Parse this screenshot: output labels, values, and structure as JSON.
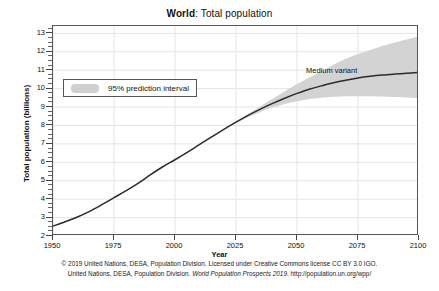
{
  "chart_data": {
    "type": "line",
    "title": "World: Total population",
    "title_bold_part": "World",
    "title_rest": ": Total population",
    "xlabel": "Year",
    "ylabel": "Total population (billions)",
    "xlim": [
      1950,
      2100
    ],
    "ylim": [
      2,
      13.4
    ],
    "xticks": [
      1950,
      1975,
      2000,
      2025,
      2050,
      2075,
      2100
    ],
    "yticks": [
      2,
      3,
      4,
      5,
      6,
      7,
      8,
      9,
      10,
      11,
      12,
      13
    ],
    "grid": true,
    "legend_position": "upper-left",
    "legend": [
      {
        "label": "95% prediction interval",
        "color": "#d0d0d0",
        "style": "band"
      }
    ],
    "annotations": [
      {
        "text": "Medium variant",
        "x": 2062,
        "y": 10.6
      }
    ],
    "series": [
      {
        "name": "Medium variant",
        "color": "#2b2b2b",
        "x": [
          1950,
          1955,
          1960,
          1965,
          1970,
          1975,
          1980,
          1985,
          1990,
          1995,
          2000,
          2005,
          2010,
          2015,
          2020,
          2025,
          2030,
          2035,
          2040,
          2045,
          2050,
          2055,
          2060,
          2065,
          2070,
          2075,
          2080,
          2085,
          2090,
          2095,
          2100
        ],
        "values": [
          2.54,
          2.77,
          3.03,
          3.34,
          3.7,
          4.08,
          4.46,
          4.87,
          5.33,
          5.76,
          6.14,
          6.54,
          6.96,
          7.38,
          7.79,
          8.18,
          8.55,
          8.89,
          9.2,
          9.48,
          9.74,
          9.97,
          10.15,
          10.32,
          10.46,
          10.58,
          10.67,
          10.74,
          10.79,
          10.83,
          10.88
        ]
      },
      {
        "name": "95% prediction interval upper",
        "color": "#d0d0d0",
        "x": [
          2020,
          2030,
          2040,
          2050,
          2060,
          2070,
          2080,
          2090,
          2100
        ],
        "values": [
          7.8,
          8.64,
          9.45,
          10.25,
          10.95,
          11.62,
          12.1,
          12.5,
          12.85
        ]
      },
      {
        "name": "95% prediction interval lower",
        "color": "#d0d0d0",
        "x": [
          2020,
          2030,
          2040,
          2050,
          2060,
          2070,
          2080,
          2090,
          2100
        ],
        "values": [
          7.78,
          8.46,
          8.98,
          9.32,
          9.5,
          9.58,
          9.58,
          9.55,
          9.48
        ]
      }
    ]
  },
  "footer": {
    "line1": "© 2019 United Nations, DESA, Population Division. Licensed under Creative Commons license CC BY 3.0 IGO.",
    "line2_pre": "United Nations, DESA, Population Division. ",
    "line2_italic": "World Population Prospects 2019",
    "line2_post": ". http://population.un.org/wpp/"
  }
}
